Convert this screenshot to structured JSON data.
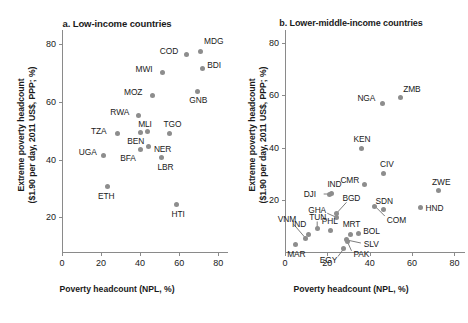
{
  "figure": {
    "axis_color": "#8a8a8a",
    "marker_color": "#8d8d8d",
    "text_color": "#1a1a1a"
  },
  "chart_data": [
    {
      "type": "scatter",
      "panel_id": "a",
      "title": "a. Low-income countries",
      "xlabel": "Poverty headcount (NPL, %)",
      "ylabel": "Extreme poverty headcount\n($1.90 per day, 2011 US$, PPP; %)",
      "ylabel_line1": "Extreme poverty headcount",
      "ylabel_line2": "($1.90 per day, 2011 US$, PPP; %)",
      "xlim": [
        0,
        85
      ],
      "ylim": [
        8,
        85
      ],
      "xticks": [
        0,
        20,
        40,
        60,
        80
      ],
      "yticks": [
        20,
        40,
        60,
        80
      ],
      "grid": false,
      "legend": "none",
      "points": [
        {
          "label": "MDG",
          "x": 70.7,
          "y": 77.6,
          "lx": 4,
          "ly": -10,
          "anchor": "left"
        },
        {
          "label": "COD",
          "x": 63.9,
          "y": 76.6,
          "lx": -27,
          "ly": -3,
          "anchor": "left"
        },
        {
          "label": "BDI",
          "x": 71.8,
          "y": 71.8,
          "lx": 5,
          "ly": -3,
          "anchor": "left"
        },
        {
          "label": "MWI",
          "x": 51.5,
          "y": 70.3,
          "lx": -27,
          "ly": -3,
          "anchor": "left"
        },
        {
          "label": "GNB",
          "x": 69.3,
          "y": 63.7,
          "lx": -8,
          "ly": 9,
          "anchor": "left"
        },
        {
          "label": "MOZ",
          "x": 46.1,
          "y": 62.4,
          "lx": -28,
          "ly": -3,
          "anchor": "left"
        },
        {
          "label": "RWA",
          "x": 39.1,
          "y": 55.5,
          "lx": -28,
          "ly": -3,
          "anchor": "left"
        },
        {
          "label": "MLI",
          "x": 43.6,
          "y": 49.7,
          "lx": -9,
          "ly": -8,
          "anchor": "left"
        },
        {
          "label": "TZA",
          "x": 28.2,
          "y": 49.1,
          "lx": -26,
          "ly": -3,
          "anchor": "left"
        },
        {
          "label": "TGO",
          "x": 55.1,
          "y": 49.2,
          "lx": -6,
          "ly": -9,
          "anchor": "left"
        },
        {
          "label": "BEN",
          "x": 40.1,
          "y": 49.6,
          "lx": -13,
          "ly": 9,
          "anchor": "left"
        },
        {
          "label": "NER",
          "x": 44.5,
          "y": 44.5,
          "lx": 5,
          "ly": 2,
          "anchor": "left"
        },
        {
          "label": "BFA",
          "x": 40.1,
          "y": 43.7,
          "lx": -20,
          "ly": 9,
          "anchor": "left"
        },
        {
          "label": "UGA",
          "x": 21.4,
          "y": 41.5,
          "lx": -25,
          "ly": -3,
          "anchor": "left"
        },
        {
          "label": "LBR",
          "x": 50.9,
          "y": 40.9,
          "lx": -4,
          "ly": 10,
          "anchor": "left"
        },
        {
          "label": "ETH",
          "x": 23.5,
          "y": 30.8,
          "lx": -10,
          "ly": 10,
          "anchor": "left"
        },
        {
          "label": "HTI",
          "x": 58.6,
          "y": 24.5,
          "lx": -5,
          "ly": 10,
          "anchor": "left"
        }
      ]
    },
    {
      "type": "scatter",
      "panel_id": "b",
      "title": "b. Lower-middle-income countries",
      "xlabel": "Poverty headcount (NPL, %)",
      "ylabel_line1": "Extreme poverty headcount",
      "ylabel_line2": "($1.90 per day, 2011 US$, PPP; %)",
      "xlim": [
        0,
        85
      ],
      "ylim": [
        0,
        85
      ],
      "xticks": [
        0,
        20,
        40,
        60,
        80
      ],
      "yticks": [
        20,
        40,
        60,
        80
      ],
      "grid": false,
      "legend": "none",
      "points": [
        {
          "label": "ZMB",
          "x": 54.4,
          "y": 59.1,
          "lx": 3,
          "ly": -9,
          "anchor": "left"
        },
        {
          "label": "NGA",
          "x": 46.0,
          "y": 56.8,
          "lx": -25,
          "ly": -6,
          "anchor": "left"
        },
        {
          "label": "KEN",
          "x": 36.1,
          "y": 39.8,
          "lx": -8,
          "ly": -9,
          "anchor": "left"
        },
        {
          "label": "CIV",
          "x": 46.3,
          "y": 30.2,
          "lx": -3,
          "ly": -9,
          "anchor": "left"
        },
        {
          "label": "CMR",
          "x": 37.5,
          "y": 26.0,
          "lx": -24,
          "ly": -4,
          "anchor": "left"
        },
        {
          "label": "ZWE",
          "x": 72.3,
          "y": 23.5,
          "lx": -6,
          "ly": -9,
          "anchor": "left"
        },
        {
          "label": "IND",
          "x": 21.9,
          "y": 22.5,
          "lx": -4,
          "ly": -9,
          "anchor": "left"
        },
        {
          "label": "DJI",
          "x": 21.1,
          "y": 22.2,
          "lx": -26,
          "ly": 0,
          "anchor": "left",
          "leader": {
            "x2": -6,
            "y2": 0
          }
        },
        {
          "label": "BGD",
          "x": 24.3,
          "y": 14.8,
          "lx": 6,
          "ly": -15,
          "anchor": "left",
          "leader": {
            "x2": 10,
            "y2": -11
          }
        },
        {
          "label": "HND",
          "x": 64.0,
          "y": 17.2,
          "lx": 5,
          "ly": 1,
          "anchor": "left"
        },
        {
          "label": "SDN",
          "x": 46.5,
          "y": 16.2,
          "lx": -8,
          "ly": -9,
          "anchor": "left"
        },
        {
          "label": "COM",
          "x": 42.4,
          "y": 17.6,
          "lx": 12,
          "ly": 14,
          "anchor": "left",
          "leader": {
            "x2": 10,
            "y2": 10
          }
        },
        {
          "label": "GHA",
          "x": 24.2,
          "y": 13.3,
          "lx": -28,
          "ly": -7,
          "anchor": "left",
          "leader": {
            "x2": -9,
            "y2": -4
          }
        },
        {
          "label": "TUN",
          "x": 15.2,
          "y": 9.0,
          "lx": -8,
          "ly": -11,
          "anchor": "left",
          "leader": {
            "x2": 0,
            "y2": -7
          }
        },
        {
          "label": "VNM",
          "x": 9.8,
          "y": 5.2,
          "lx": -28,
          "ly": -19,
          "anchor": "left",
          "leader": {
            "x2": -12,
            "y2": -14
          }
        },
        {
          "label": "IND",
          "x": 10.9,
          "y": 6.8,
          "lx": -16,
          "ly": -10,
          "anchor": "left"
        },
        {
          "label": "PHL",
          "x": 21.6,
          "y": 8.3,
          "lx": -9,
          "ly": -9,
          "anchor": "left"
        },
        {
          "label": "MRT",
          "x": 31.0,
          "y": 6.6,
          "lx": -8,
          "ly": -11,
          "anchor": "left"
        },
        {
          "label": "BOL",
          "x": 34.6,
          "y": 7.1,
          "lx": 5,
          "ly": -2,
          "anchor": "left"
        },
        {
          "label": "SLV",
          "x": 29.2,
          "y": 4.6,
          "lx": 17,
          "ly": 4,
          "anchor": "left",
          "leader": {
            "x2": 14,
            "y2": 3
          }
        },
        {
          "label": "EGY",
          "x": 27.8,
          "y": 1.3,
          "lx": -24,
          "ly": 11,
          "anchor": "left",
          "leader": {
            "x2": -6,
            "y2": 8
          }
        },
        {
          "label": "PAK",
          "x": 29.5,
          "y": 3.9,
          "lx": 6,
          "ly": 12,
          "anchor": "left",
          "leader": {
            "x2": 4,
            "y2": 9
          }
        },
        {
          "label": "MAR",
          "x": 4.8,
          "y": 2.9,
          "lx": -8,
          "ly": 10,
          "anchor": "left"
        }
      ]
    }
  ]
}
